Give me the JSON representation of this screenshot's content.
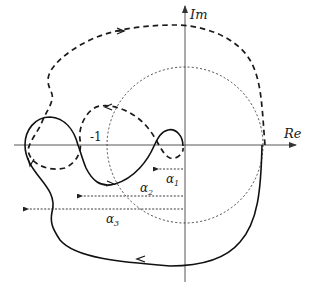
{
  "diagram": {
    "title": "",
    "axes": {
      "real_label": "Re",
      "imag_label": "Im"
    },
    "unit_circle": {
      "label": "-1",
      "style": "dotted"
    },
    "curves": [
      {
        "name": "outer-contour",
        "style": "dashed"
      },
      {
        "name": "nyquist-curve",
        "style": "solid"
      }
    ],
    "distances": [
      {
        "symbol": "α",
        "subscript": "1"
      },
      {
        "symbol": "α",
        "subscript": "2"
      },
      {
        "symbol": "α",
        "subscript": "3"
      }
    ],
    "colors": {
      "stroke": "#1a1a1a",
      "background": "#ffffff"
    }
  }
}
